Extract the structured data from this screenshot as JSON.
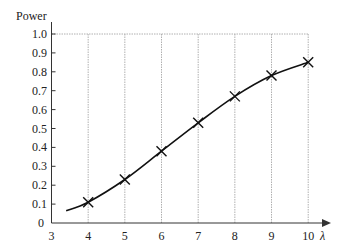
{
  "chart_data": {
    "type": "line",
    "title": "",
    "xlabel": "λ",
    "ylabel": "Power",
    "xlim": [
      3,
      10
    ],
    "ylim": [
      0,
      1.0
    ],
    "x_ticks": [
      "3",
      "4",
      "5",
      "6",
      "7",
      "8",
      "9",
      "10"
    ],
    "y_ticks": [
      "0",
      "0.1",
      "0.2",
      "0.3",
      "0.4",
      "0.5",
      "0.6",
      "0.7",
      "0.8",
      "0.9",
      "1.0"
    ],
    "grid": "vertical dotted lines at x=4..10 and horizontal line at y=1.0",
    "legend": null,
    "series": [
      {
        "name": "Power curve",
        "style": "smooth solid line",
        "x": [
          3.4,
          4,
          5,
          6,
          7,
          8,
          9,
          10
        ],
        "values": [
          0.065,
          0.11,
          0.23,
          0.38,
          0.53,
          0.67,
          0.78,
          0.85
        ]
      },
      {
        "name": "Markers",
        "style": "x markers",
        "x": [
          4,
          5,
          6,
          7,
          8,
          9,
          10
        ],
        "values": [
          0.11,
          0.23,
          0.38,
          0.53,
          0.67,
          0.78,
          0.85
        ]
      }
    ]
  },
  "colors": {
    "axis": "#333333",
    "grid": "#b0b0b0",
    "line": "#111111"
  }
}
